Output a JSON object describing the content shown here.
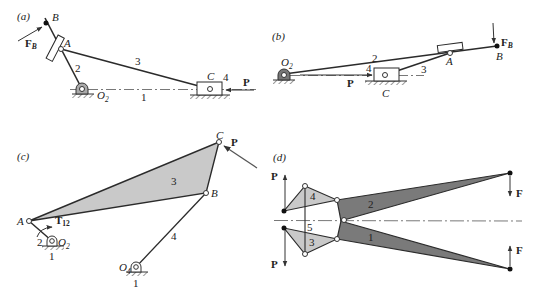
{
  "figure": {
    "panels": [
      {
        "id": "a",
        "label": "(a)",
        "points": {
          "B": "B",
          "A": "A",
          "C": "C",
          "O2": "O",
          "O2_sub": "2"
        },
        "links": {
          "l1": "1",
          "l2": "2",
          "l3": "3",
          "l4": "4"
        },
        "forces": {
          "FB": "F",
          "FB_sub": "B",
          "P": "P"
        }
      },
      {
        "id": "b",
        "label": "(b)",
        "points": {
          "B": "B",
          "A": "A",
          "C": "C",
          "O2": "O",
          "O2_sub": "2"
        },
        "links": {
          "l2": "2",
          "l3": "3",
          "l4": "4"
        },
        "forces": {
          "FB": "F",
          "FB_sub": "B",
          "P": "P"
        }
      },
      {
        "id": "c",
        "label": "(c)",
        "points": {
          "A": "A",
          "B": "B",
          "C": "C",
          "O2": "O",
          "O2_sub": "2",
          "O4": "O",
          "O4_sub": "4"
        },
        "links": {
          "l1a": "1",
          "l1b": "1",
          "l2": "2",
          "l3": "3",
          "l4": "4"
        },
        "forces": {
          "P": "P",
          "T": "T",
          "T_sub": "12"
        }
      },
      {
        "id": "d",
        "label": "(d)",
        "links": {
          "l1": "1",
          "l2": "2",
          "l3": "3",
          "l4": "4",
          "l5": "5"
        },
        "forces": {
          "P_top": "P",
          "P_bottom": "P",
          "F_top": "F",
          "F_bottom": "F"
        }
      }
    ],
    "colors": {
      "line": "#2b2b2b",
      "light_fill": "#c8c8c8",
      "dark_fill": "#7a7a7a",
      "ground_hatch": "#555555"
    }
  }
}
